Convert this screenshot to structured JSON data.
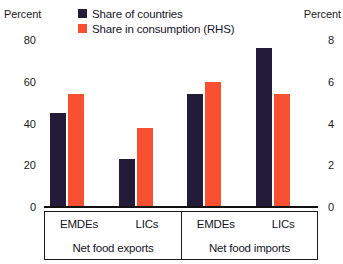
{
  "axes": {
    "left_title": "Percent",
    "right_title": "Percent"
  },
  "legend": {
    "entries": [
      {
        "label": "Share of countries",
        "color": "#221c38"
      },
      {
        "label": "Share in consumption (RHS)",
        "color": "#fa5032"
      }
    ]
  },
  "chart_data": {
    "type": "bar",
    "title": "",
    "xlabel": "",
    "ylabel": "Percent",
    "y2label": "Percent",
    "ylim": [
      0,
      80
    ],
    "y2lim": [
      0,
      8
    ],
    "yticks": [
      0,
      20,
      40,
      60,
      80
    ],
    "y2ticks": [
      0,
      2,
      4,
      6,
      8
    ],
    "grid": false,
    "legend_position": "top",
    "categories": [
      "EMDEs",
      "LICs",
      "EMDEs",
      "LICs"
    ],
    "group_labels": [
      "Net food exports",
      "Net food imports"
    ],
    "groups": [
      {
        "label": "Net food exports",
        "categories": [
          "EMDEs",
          "LICs"
        ]
      },
      {
        "label": "Net food imports",
        "categories": [
          "EMDEs",
          "LICs"
        ]
      }
    ],
    "series": [
      {
        "name": "Share of countries",
        "axis": "left",
        "color": "#221c38",
        "values": [
          45,
          23,
          54,
          76
        ]
      },
      {
        "name": "Share in consumption (RHS)",
        "axis": "right",
        "color": "#fa5032",
        "values": [
          5.4,
          3.8,
          6.0,
          5.4
        ]
      }
    ]
  }
}
